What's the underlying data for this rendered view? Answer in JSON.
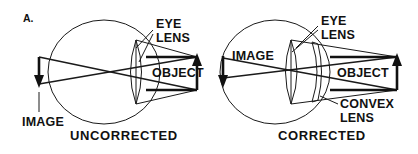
{
  "figure": {
    "panel_label": "A.",
    "background_color": "#ffffff",
    "ink_color": "#111111"
  },
  "panels": [
    {
      "id": "uncorrected",
      "caption": "UNCORRECTED",
      "labels": {
        "eye_lens_line1": "EYE",
        "eye_lens_line2": "LENS",
        "object": "OBJECT",
        "image": "IMAGE"
      },
      "parts": [
        "eyeball-circle",
        "eye-lens",
        "light-rays",
        "object-arrow",
        "image-arrow",
        "eye-lens-leader",
        "image-leader"
      ]
    },
    {
      "id": "corrected",
      "caption": "CORRECTED",
      "labels": {
        "eye_lens_line1": "EYE",
        "eye_lens_line2": "LENS",
        "object": "OBJECT",
        "image": "IMAGE",
        "convex_lens_line1": "CONVEX",
        "convex_lens_line2": "LENS"
      },
      "parts": [
        "eyeball-circle",
        "eye-lens",
        "convex-lens",
        "light-rays",
        "object-arrow",
        "image-arrow",
        "eye-lens-leader",
        "convex-lens-leader"
      ]
    }
  ]
}
